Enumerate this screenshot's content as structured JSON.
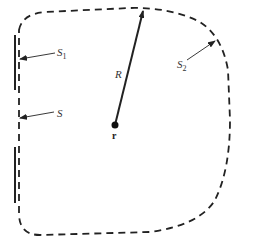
{
  "diagram": {
    "type": "geometry-schematic",
    "colors": {
      "stroke": "#222222",
      "background": "#ffffff",
      "label": "#333333"
    },
    "labels": {
      "s1": {
        "main": "S",
        "sub": "1"
      },
      "s": {
        "main": "S"
      },
      "s2": {
        "main": "S",
        "sub": "2"
      },
      "radius": "R",
      "point": "r"
    }
  }
}
